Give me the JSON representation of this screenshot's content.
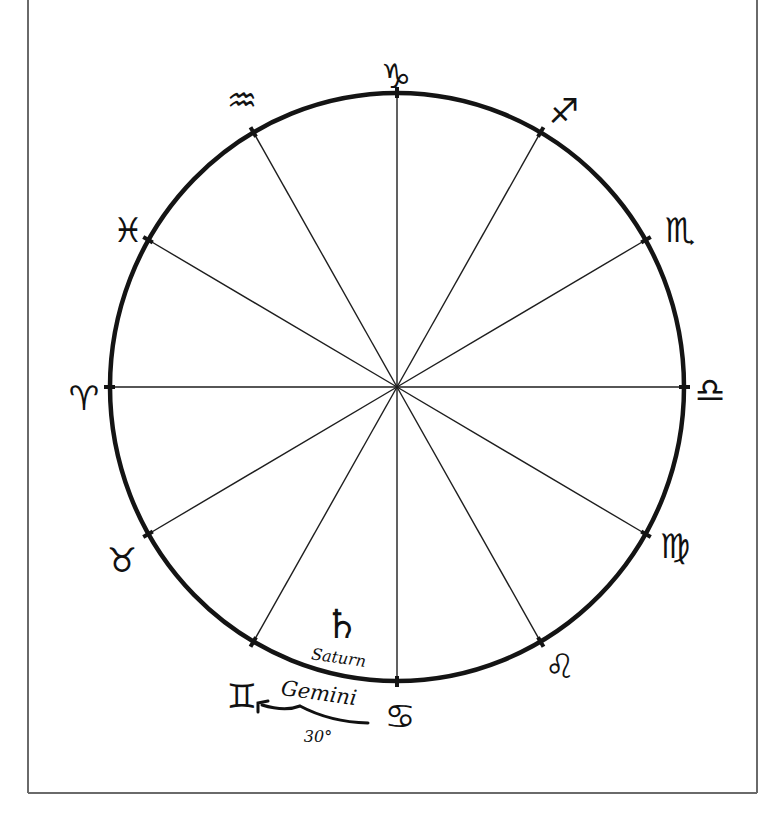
{
  "diagram": {
    "center": {
      "x": 397,
      "y": 387
    },
    "radius": {
      "rx": 287,
      "ry": 294
    },
    "divisions": 12,
    "signs": [
      {
        "name": "Capricorn",
        "symbol": "♑",
        "angle_deg": 90,
        "label_x": 396,
        "label_y": 78
      },
      {
        "name": "Sagittarius",
        "symbol": "♐",
        "angle_deg": 60,
        "label_x": 564,
        "label_y": 113
      },
      {
        "name": "Scorpio",
        "symbol": "♏",
        "angle_deg": 30,
        "label_x": 680,
        "label_y": 232
      },
      {
        "name": "Libra",
        "symbol": "♎",
        "angle_deg": 0,
        "label_x": 710,
        "label_y": 392
      },
      {
        "name": "Virgo",
        "symbol": "♍",
        "angle_deg": -30,
        "label_x": 675,
        "label_y": 548
      },
      {
        "name": "Leo",
        "symbol": "♌",
        "angle_deg": -60,
        "label_x": 560,
        "label_y": 668
      },
      {
        "name": "Cancer",
        "symbol": "♋",
        "angle_deg": -90,
        "label_x": 400,
        "label_y": 718
      },
      {
        "name": "Gemini",
        "symbol": "♊",
        "angle_deg": -120,
        "label_x": 242,
        "label_y": 698
      },
      {
        "name": "Taurus",
        "symbol": "♉",
        "angle_deg": -150,
        "label_x": 122,
        "label_y": 562
      },
      {
        "name": "Aries",
        "symbol": "♈",
        "angle_deg": 180,
        "label_x": 84,
        "label_y": 400
      },
      {
        "name": "Pisces",
        "symbol": "♓",
        "angle_deg": 150,
        "label_x": 128,
        "label_y": 232
      },
      {
        "name": "Aquarius",
        "symbol": "♒",
        "angle_deg": 120,
        "label_x": 242,
        "label_y": 102
      }
    ],
    "planet": {
      "name": "Saturn",
      "symbol": "♄",
      "label": "Saturn"
    },
    "annotation": {
      "sign_label": "Gemini",
      "arc_label": "30°"
    }
  },
  "colors": {
    "ink": "#111111",
    "frame": "#6a6a6a",
    "background": "#ffffff"
  }
}
